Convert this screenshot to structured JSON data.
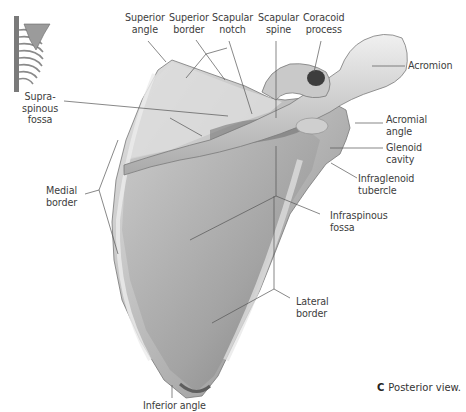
{
  "figure": {
    "panel_letter": "C",
    "caption": "Posterior view.",
    "view": "Posterior view of right scapula",
    "colors": {
      "bone_light": "#d9d9d9",
      "bone_mid": "#b3b3b3",
      "bone_dark": "#6e6e6e",
      "leader_line": "#555555",
      "text": "#3d3d3d"
    },
    "labels": {
      "superior_angle": "Superior\nangle",
      "superior_border": "Superior\nborder",
      "scapular_notch": "Scapular\nnotch",
      "scapular_spine": "Scapular\nspine",
      "coracoid_process": "Coracoid\nprocess",
      "acromion": "Acromion",
      "supraspinous_fossa": "Supra-\nspinous\nfossa",
      "acromial_angle": "Acromial\nangle",
      "glenoid_cavity": "Glenoid\ncavity",
      "medial_border": "Medial\nborder",
      "infraglenoid_tubercle": "Infraglenoid\ntubercle",
      "infraspinous_fossa": "Infraspinous\nfossa",
      "lateral_border": "Lateral\nborder",
      "inferior_angle": "Inferior angle"
    },
    "thumbnail": "thorax-skeleton-orientation-icon"
  }
}
